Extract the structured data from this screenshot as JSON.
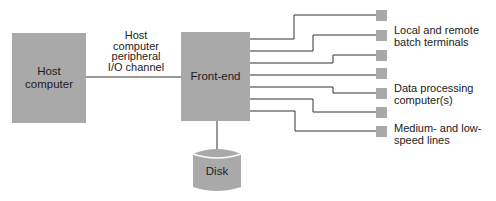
{
  "diagram": {
    "type": "block-diagram",
    "nodes": {
      "host": {
        "label": "Host\ncomputer"
      },
      "frontend": {
        "label": "Front-end"
      },
      "disk": {
        "label": "Disk"
      }
    },
    "edges": {
      "channel": {
        "label": "Host\ncomputer\nperipheral\nI/O channel",
        "from": "host",
        "to": "frontend"
      },
      "disk_link": {
        "from": "frontend",
        "to": "disk"
      }
    },
    "terminal_count": 7,
    "terminal_labels": [
      "Local and remote\nbatch terminals",
      "Data processing\ncomputer(s)",
      "Medium- and low-\nspeed lines"
    ],
    "colors": {
      "box_fill": "#a9a9a9",
      "line": "#333333",
      "text": "#1a1a1a"
    }
  }
}
